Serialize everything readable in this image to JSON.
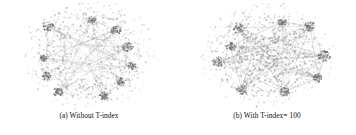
{
  "figure": {
    "background_color": "#ffffff",
    "node_color": "#9a9a9a",
    "hub_color": "#6a6a6a",
    "edge_color": "#b9b9b9",
    "caption_color": "#15110f"
  },
  "panels": [
    {
      "id": "panel-a",
      "caption": "(a)  Without T-index",
      "label": "(a)",
      "title": "Without T-index"
    },
    {
      "id": "panel-b",
      "caption": "(b)  With T-index= 100",
      "label": "(b)",
      "title": "With T-index= 100"
    }
  ],
  "chart_data": [
    {
      "type": "scatter",
      "title": "(a)  Without T-index",
      "xlabel": "",
      "ylabel": "",
      "description": "Force-directed node-link layout of a network without T-index; nodes drawn as small grey squares spread in a broad round blob with roughly 8 darker hub clusters and faint straight edges between hubs.",
      "node_count": 640,
      "hub_count": 8,
      "layout": "round-diffuse",
      "core_density": 0.38,
      "hubs": [
        {
          "x": 48,
          "y": 26,
          "r": 5.0,
          "strength": 0.85
        },
        {
          "x": 92,
          "y": 20,
          "r": 3.6,
          "strength": 0.62
        },
        {
          "x": 116,
          "y": 30,
          "r": 4.2,
          "strength": 0.78
        },
        {
          "x": 128,
          "y": 47,
          "r": 4.6,
          "strength": 0.82
        },
        {
          "x": 132,
          "y": 66,
          "r": 3.8,
          "strength": 0.7
        },
        {
          "x": 122,
          "y": 82,
          "r": 4.4,
          "strength": 0.8
        },
        {
          "x": 44,
          "y": 58,
          "r": 3.4,
          "strength": 0.6
        },
        {
          "x": 46,
          "y": 76,
          "r": 4.6,
          "strength": 0.84
        },
        {
          "x": 58,
          "y": 92,
          "r": 4.2,
          "strength": 0.78
        },
        {
          "x": 104,
          "y": 96,
          "r": 4.0,
          "strength": 0.74
        }
      ],
      "xlim": [
        0,
        178
      ],
      "ylim": [
        0,
        110
      ],
      "grid": false,
      "legend": null
    },
    {
      "type": "scatter",
      "title": "(b)  With T-index= 100",
      "xlabel": "",
      "ylabel": "",
      "description": "Force-directed node-link layout of the same network with T-index = 100; nodes are pulled into a dense dark rectangular core with star-like spiky hub arms protruding at the periphery.",
      "node_count": 700,
      "hub_count": 9,
      "layout": "dense-core-spiky",
      "core_density": 0.78,
      "hubs": [
        {
          "x": 60,
          "y": 28,
          "r": 5.2,
          "strength": 0.9
        },
        {
          "x": 104,
          "y": 22,
          "r": 4.0,
          "strength": 0.7
        },
        {
          "x": 132,
          "y": 26,
          "r": 5.0,
          "strength": 0.88
        },
        {
          "x": 146,
          "y": 56,
          "r": 5.4,
          "strength": 0.92
        },
        {
          "x": 140,
          "y": 78,
          "r": 4.4,
          "strength": 0.8
        },
        {
          "x": 106,
          "y": 92,
          "r": 4.6,
          "strength": 0.84
        },
        {
          "x": 64,
          "y": 90,
          "r": 5.0,
          "strength": 0.88
        },
        {
          "x": 40,
          "y": 62,
          "r": 5.2,
          "strength": 0.9
        },
        {
          "x": 52,
          "y": 46,
          "r": 4.0,
          "strength": 0.72
        }
      ],
      "xlim": [
        0,
        178
      ],
      "ylim": [
        0,
        110
      ],
      "grid": false,
      "legend": null
    }
  ]
}
